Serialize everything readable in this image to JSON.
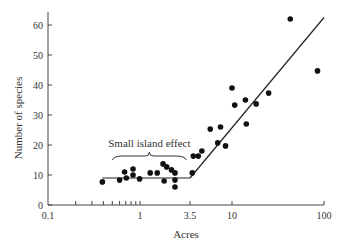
{
  "chart_data": {
    "type": "scatter",
    "title": "",
    "xlabel": "Acres",
    "ylabel": "Number of species",
    "xscale": "log",
    "xlim": [
      0.1,
      100
    ],
    "ylim": [
      0,
      65
    ],
    "x_ticks": [
      {
        "value": 0.1,
        "label": "0.1"
      },
      {
        "value": 1,
        "label": "1"
      },
      {
        "value": 3.5,
        "label": "3.5"
      },
      {
        "value": 10,
        "label": "10"
      },
      {
        "value": 100,
        "label": "100"
      }
    ],
    "x_minor_ticks": [
      0.2,
      0.3,
      0.4,
      0.5,
      0.6,
      0.7,
      0.8,
      0.9
    ],
    "y_ticks": [
      0,
      10,
      20,
      30,
      40,
      50,
      60
    ],
    "grid": false,
    "legend": null,
    "annotation": {
      "text": "Small island effect",
      "x_range": [
        0.5,
        3.2
      ],
      "brace": true
    },
    "series": [
      {
        "name": "Islands",
        "points": [
          {
            "x": 0.39,
            "y": 7.7
          },
          {
            "x": 0.6,
            "y": 8.3
          },
          {
            "x": 0.68,
            "y": 11.0
          },
          {
            "x": 0.71,
            "y": 9.0
          },
          {
            "x": 0.84,
            "y": 12.0
          },
          {
            "x": 0.84,
            "y": 10.0
          },
          {
            "x": 0.99,
            "y": 8.7
          },
          {
            "x": 1.29,
            "y": 10.7
          },
          {
            "x": 1.54,
            "y": 10.7
          },
          {
            "x": 1.78,
            "y": 13.7
          },
          {
            "x": 1.95,
            "y": 12.7
          },
          {
            "x": 2.2,
            "y": 11.7
          },
          {
            "x": 2.4,
            "y": 10.7
          },
          {
            "x": 1.83,
            "y": 8.0
          },
          {
            "x": 2.4,
            "y": 8.3
          },
          {
            "x": 2.4,
            "y": 6.0
          },
          {
            "x": 3.8,
            "y": 16.3
          },
          {
            "x": 4.3,
            "y": 16.3
          },
          {
            "x": 4.7,
            "y": 18.0
          },
          {
            "x": 3.7,
            "y": 10.7
          },
          {
            "x": 5.8,
            "y": 25.3
          },
          {
            "x": 7.0,
            "y": 20.7
          },
          {
            "x": 7.5,
            "y": 26.0
          },
          {
            "x": 8.5,
            "y": 19.7
          },
          {
            "x": 10.0,
            "y": 39.0
          },
          {
            "x": 10.7,
            "y": 33.3
          },
          {
            "x": 14.0,
            "y": 35.0
          },
          {
            "x": 14.3,
            "y": 27.0
          },
          {
            "x": 18.3,
            "y": 33.7
          },
          {
            "x": 25.0,
            "y": 37.3
          },
          {
            "x": 43.0,
            "y": 62.0
          },
          {
            "x": 85.0,
            "y": 44.7
          }
        ]
      }
    ],
    "fit_line": {
      "segments": [
        {
          "from": {
            "x": 0.39,
            "y": 9.0
          },
          "to": {
            "x": 3.5,
            "y": 9.0
          }
        },
        {
          "from": {
            "x": 3.5,
            "y": 9.0
          },
          "to": {
            "x": 100,
            "y": 62.5
          }
        }
      ]
    }
  }
}
